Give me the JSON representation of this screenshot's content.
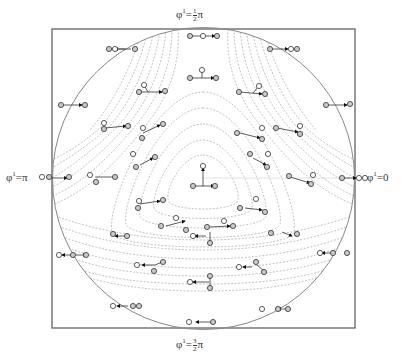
{
  "figure": {
    "frame": {
      "x": 52,
      "y": 29,
      "width": 303,
      "height": 299,
      "stroke": "#555555"
    },
    "circle": {
      "cx": 203.5,
      "cy": 178.5,
      "r": 151,
      "stroke": "#888888"
    },
    "labels": {
      "top": {
        "symbol": "φ",
        "sup": "1",
        "eq": "=",
        "num": "1",
        "den": "2",
        "tail": "π"
      },
      "bottom": {
        "symbol": "φ",
        "sup": "1",
        "eq": "=",
        "num": "3",
        "den": "2",
        "tail": "π"
      },
      "left": {
        "symbol": "φ",
        "sup": "1",
        "eq": "=",
        "tail": "π"
      },
      "right": {
        "symbol": "φ",
        "sup": "1",
        "eq": "=",
        "tail": "0"
      }
    },
    "colors": {
      "contour": "#9a9a9a",
      "glyph_node": "#777777",
      "glyph_fill": "#bdbdbd",
      "arrow": "#111111"
    }
  }
}
